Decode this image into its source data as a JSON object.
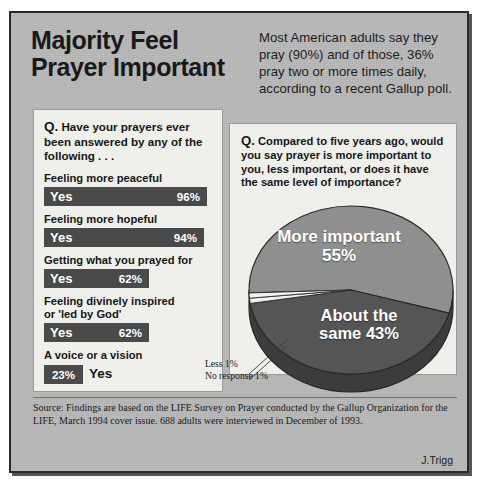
{
  "headline": "Majority Feel Prayer Important",
  "intro": "Most American adults say they pray (90%) and of those, 36% pray two or more times daily, according to a recent Gallup poll.",
  "left_panel": {
    "question_marker": "Q.",
    "question": " Have your prayers ever been answered by any of the following . . .",
    "yes_label": "Yes"
  },
  "right_panel": {
    "question_marker": "Q.",
    "question": " Compared to five years ago, would you say prayer is more important to you, less important, or does it have the same level of importance?"
  },
  "footer": {
    "source": "Source: Findings are based on the LIFE Survey on Prayer conducted by the Gallup Organization for the LIFE, March 1994 cover issue. 688 adults were interviewed in December of 1993.",
    "credit": "J.Trigg"
  },
  "colors": {
    "poster_bg": "#b9b9b9",
    "panel_bg": "#efefec",
    "bar_fill": "#4a4a4a",
    "pie_more": "#8f8f8f",
    "pie_same": "#555555",
    "pie_sliver": "#f2f2f2"
  },
  "chart_data": [
    {
      "type": "bar",
      "title": "Q. Have your prayers ever been answered by any of the following . . .",
      "orientation": "horizontal",
      "categories": [
        "Feeling more peaceful",
        "Feeling more hopeful",
        "Getting what you prayed for",
        "Feeling divinely inspired or 'led by God'",
        "A voice or a vision"
      ],
      "values": [
        96,
        94,
        62,
        62,
        23
      ],
      "value_labels": [
        "96%",
        "94%",
        "62%",
        "62%",
        "23%"
      ],
      "series_label": "Yes",
      "xlabel": "",
      "ylabel": "",
      "xlim": [
        0,
        100
      ],
      "grid": false,
      "legend": "none",
      "bars": [
        {
          "label": "Feeling more peaceful",
          "label_lines": [
            "Feeling more peaceful"
          ],
          "value": 96,
          "value_label": "96%",
          "series_label": "Yes",
          "label_inside": true
        },
        {
          "label": "Feeling more hopeful",
          "label_lines": [
            "Feeling more hopeful"
          ],
          "value": 94,
          "value_label": "94%",
          "series_label": "Yes",
          "label_inside": true
        },
        {
          "label": "Getting what you prayed for",
          "label_lines": [
            "Getting what you prayed for"
          ],
          "value": 62,
          "value_label": "62%",
          "series_label": "Yes",
          "label_inside": true
        },
        {
          "label": "Feeling divinely inspired or 'led by God'",
          "label_lines": [
            "Feeling divinely inspired",
            "or 'led by God'"
          ],
          "value": 62,
          "value_label": "62%",
          "series_label": "Yes",
          "label_inside": true
        },
        {
          "label": "A voice or a vision",
          "label_lines": [
            "A voice or a vision"
          ],
          "value": 23,
          "value_label": "23%",
          "series_label": "Yes",
          "label_inside": false
        }
      ]
    },
    {
      "type": "pie",
      "title": "Q. Compared to five years ago, would you say prayer is more important to you, less important, or does it have the same level of importance?",
      "style": "3d",
      "labels": [
        "More important",
        "About the same",
        "Less",
        "No response"
      ],
      "values": [
        55,
        43,
        1,
        1
      ],
      "value_labels": [
        "55%",
        "43%",
        "1%",
        "1%"
      ],
      "slices": [
        {
          "label_lines": [
            "More important",
            "55%"
          ],
          "label": "More important",
          "value": 55,
          "value_label": "55%",
          "color": "#8f8f8f",
          "inside": true
        },
        {
          "label_lines": [
            "About the",
            "same 43%"
          ],
          "label": "About the same",
          "value": 43,
          "value_label": "43%",
          "color": "#555555",
          "inside": true
        },
        {
          "label": "Less 1%",
          "value": 1,
          "value_label": "1%",
          "color": "#f2f2f2",
          "inside": false
        },
        {
          "label": "No response 1%",
          "value": 1,
          "value_label": "1%",
          "color": "#f2f2f2",
          "inside": false
        }
      ],
      "callouts": [
        "Less 1%",
        "No response 1%"
      ],
      "legend": "none"
    }
  ]
}
